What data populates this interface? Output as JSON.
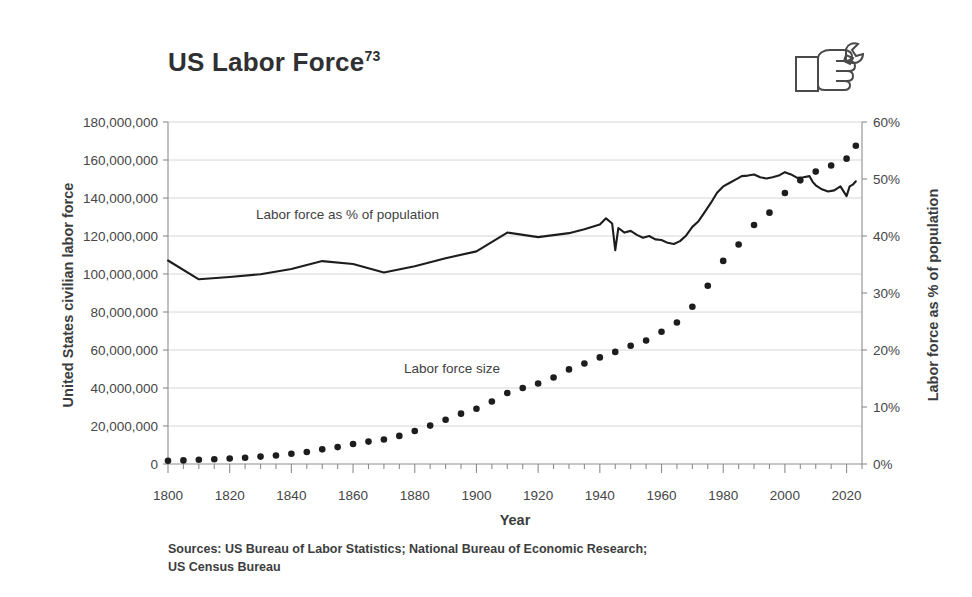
{
  "title": {
    "text": "US Labor Force",
    "superscript": "73"
  },
  "icon": {
    "name": "hand-holding-wrench-icon"
  },
  "sources": {
    "line1": "Sources: US Bureau of Labor Statistics; National Bureau of Economic Research;",
    "line2": "US Census Bureau"
  },
  "chart_data": {
    "type": "line",
    "title": "US Labor Force",
    "xlabel": "Year",
    "ylabel": "United States civilian labor force",
    "ylabel_right": "Labor force as % of population",
    "xlim": [
      1800,
      2025
    ],
    "ylim": [
      0,
      180000000
    ],
    "ylim_right": [
      0,
      60
    ],
    "grid": true,
    "legend": "inline-annotations",
    "xticks": [
      1800,
      1820,
      1840,
      1860,
      1880,
      1900,
      1920,
      1940,
      1960,
      1980,
      2000,
      2020
    ],
    "xtick_labels": [
      "1800",
      "1820",
      "1840",
      "1860",
      "1880",
      "1900",
      "1920",
      "1940",
      "1960",
      "1980",
      "2000",
      "2020"
    ],
    "xtick_minor_step": 5,
    "yticks_left": [
      0,
      20000000,
      40000000,
      60000000,
      80000000,
      100000000,
      120000000,
      140000000,
      160000000,
      180000000
    ],
    "ytick_labels_left": [
      "0",
      "20,000,000",
      "40,000,000",
      "60,000,000",
      "80,000,000",
      "100,000,000",
      "120,000,000",
      "140,000,000",
      "160,000,000",
      "180,000,000"
    ],
    "yticks_right": [
      0,
      10,
      20,
      30,
      40,
      50,
      60
    ],
    "ytick_labels_right": [
      "0%",
      "10%",
      "20%",
      "30%",
      "40%",
      "50%",
      "60%"
    ],
    "series": [
      {
        "name": "Labor force size",
        "axis": "left",
        "style": "dotted-markers",
        "color": "#1d1d1d",
        "annotation": "Labor force size",
        "x": [
          1800,
          1805,
          1810,
          1815,
          1820,
          1825,
          1830,
          1835,
          1840,
          1845,
          1850,
          1855,
          1860,
          1865,
          1870,
          1875,
          1880,
          1885,
          1890,
          1895,
          1900,
          1905,
          1910,
          1915,
          1920,
          1925,
          1930,
          1935,
          1940,
          1945,
          1950,
          1955,
          1960,
          1965,
          1970,
          1975,
          1980,
          1985,
          1990,
          1995,
          2000,
          2005,
          2010,
          2015,
          2020,
          2023
        ],
        "values": [
          1700000,
          1900000,
          2200000,
          2500000,
          2900000,
          3300000,
          3900000,
          4500000,
          5400000,
          6300000,
          7700000,
          8900000,
          10500000,
          11800000,
          12900000,
          14800000,
          17400000,
          20200000,
          23300000,
          26500000,
          29100000,
          32900000,
          37400000,
          40000000,
          42400000,
          45500000,
          49800000,
          52900000,
          56100000,
          59000000,
          62200000,
          65000000,
          69600000,
          74500000,
          82800000,
          93800000,
          106900000,
          115500000,
          125800000,
          132300000,
          142600000,
          149300000,
          153900000,
          157100000,
          160700000,
          167500000
        ]
      },
      {
        "name": "Labor force as % of population",
        "axis": "right",
        "style": "solid-line",
        "color": "#1d1d1d",
        "annotation": "Labor force as % of population",
        "x": [
          1800,
          1810,
          1820,
          1830,
          1840,
          1850,
          1860,
          1870,
          1880,
          1890,
          1900,
          1910,
          1920,
          1930,
          1935,
          1940,
          1942,
          1944,
          1945,
          1946,
          1948,
          1950,
          1952,
          1954,
          1956,
          1958,
          1960,
          1962,
          1964,
          1966,
          1968,
          1970,
          1972,
          1974,
          1976,
          1978,
          1980,
          1982,
          1984,
          1986,
          1988,
          1990,
          1992,
          1994,
          1996,
          1998,
          2000,
          2002,
          2004,
          2006,
          2008,
          2009,
          2010,
          2012,
          2014,
          2016,
          2018,
          2020,
          2021,
          2022,
          2023
        ],
        "values": [
          35.7,
          32.4,
          32.8,
          33.3,
          34.2,
          35.6,
          35.1,
          33.6,
          34.7,
          36.1,
          37.3,
          40.6,
          39.8,
          40.5,
          41.2,
          42.0,
          43.1,
          42.2,
          37.5,
          41.4,
          40.6,
          40.9,
          40.2,
          39.7,
          40.0,
          39.4,
          39.3,
          38.8,
          38.6,
          39.1,
          40.1,
          41.6,
          42.6,
          44.2,
          45.8,
          47.6,
          48.7,
          49.3,
          49.9,
          50.5,
          50.6,
          50.8,
          50.3,
          50.1,
          50.3,
          50.6,
          51.2,
          50.8,
          50.2,
          50.3,
          50.5,
          49.5,
          48.9,
          48.2,
          47.8,
          48.0,
          48.7,
          47.0,
          48.7,
          49.0,
          49.6
        ]
      }
    ]
  }
}
